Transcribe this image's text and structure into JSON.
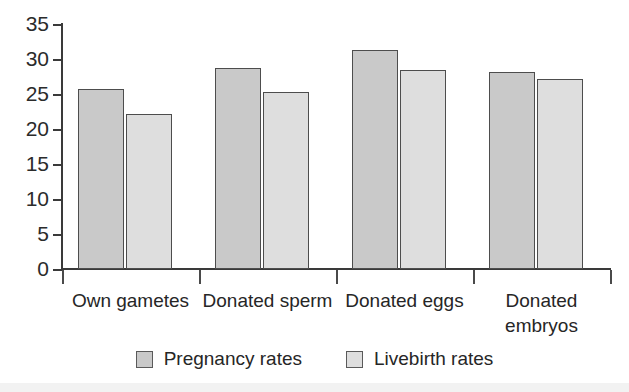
{
  "chart_data": {
    "type": "bar",
    "title": "",
    "subtitle": "",
    "xlabel": "",
    "ylabel": "",
    "ylim": [
      0,
      35
    ],
    "yticks": [
      0,
      5,
      10,
      15,
      20,
      25,
      30,
      35
    ],
    "ytick_labels": [
      "0",
      "5",
      "10",
      "15",
      "20",
      "25",
      "30",
      "35"
    ],
    "grid": false,
    "legend_position": "bottom-center",
    "categories": [
      "Own gametes",
      "Donated sperm",
      "Donated eggs",
      "Donated\nembryos"
    ],
    "series": [
      {
        "name": "Pregnancy rates",
        "color": "#c9c9c9",
        "values": [
          25.7,
          28.7,
          31.3,
          28.2
        ]
      },
      {
        "name": "Livebirth rates",
        "color": "#dedede",
        "values": [
          22.1,
          25.3,
          28.4,
          27.2
        ]
      }
    ],
    "annotations": []
  },
  "legend": {
    "items": [
      {
        "label": "Pregnancy rates",
        "swatch": "series-0-swatch"
      },
      {
        "label": "Livebirth rates",
        "swatch": "series-1-swatch"
      }
    ]
  },
  "axes": {
    "y_axis_name": "y-axis",
    "x_axis_name": "x-axis"
  }
}
